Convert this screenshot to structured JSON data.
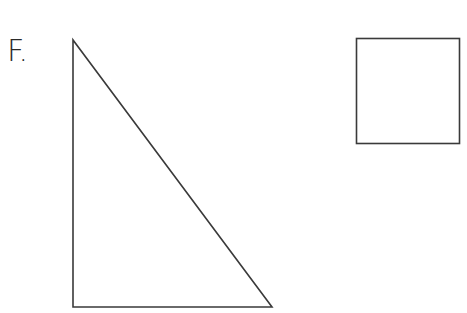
{
  "figure": {
    "label": "F.",
    "stroke_color": "#3a3a3a",
    "shapes": [
      {
        "type": "right-triangle",
        "points": [
          [
            73,
            40
          ],
          [
            73,
            307
          ],
          [
            272,
            307
          ]
        ]
      },
      {
        "type": "square",
        "x": 356,
        "y": 38,
        "width": 103,
        "height": 105
      }
    ]
  }
}
